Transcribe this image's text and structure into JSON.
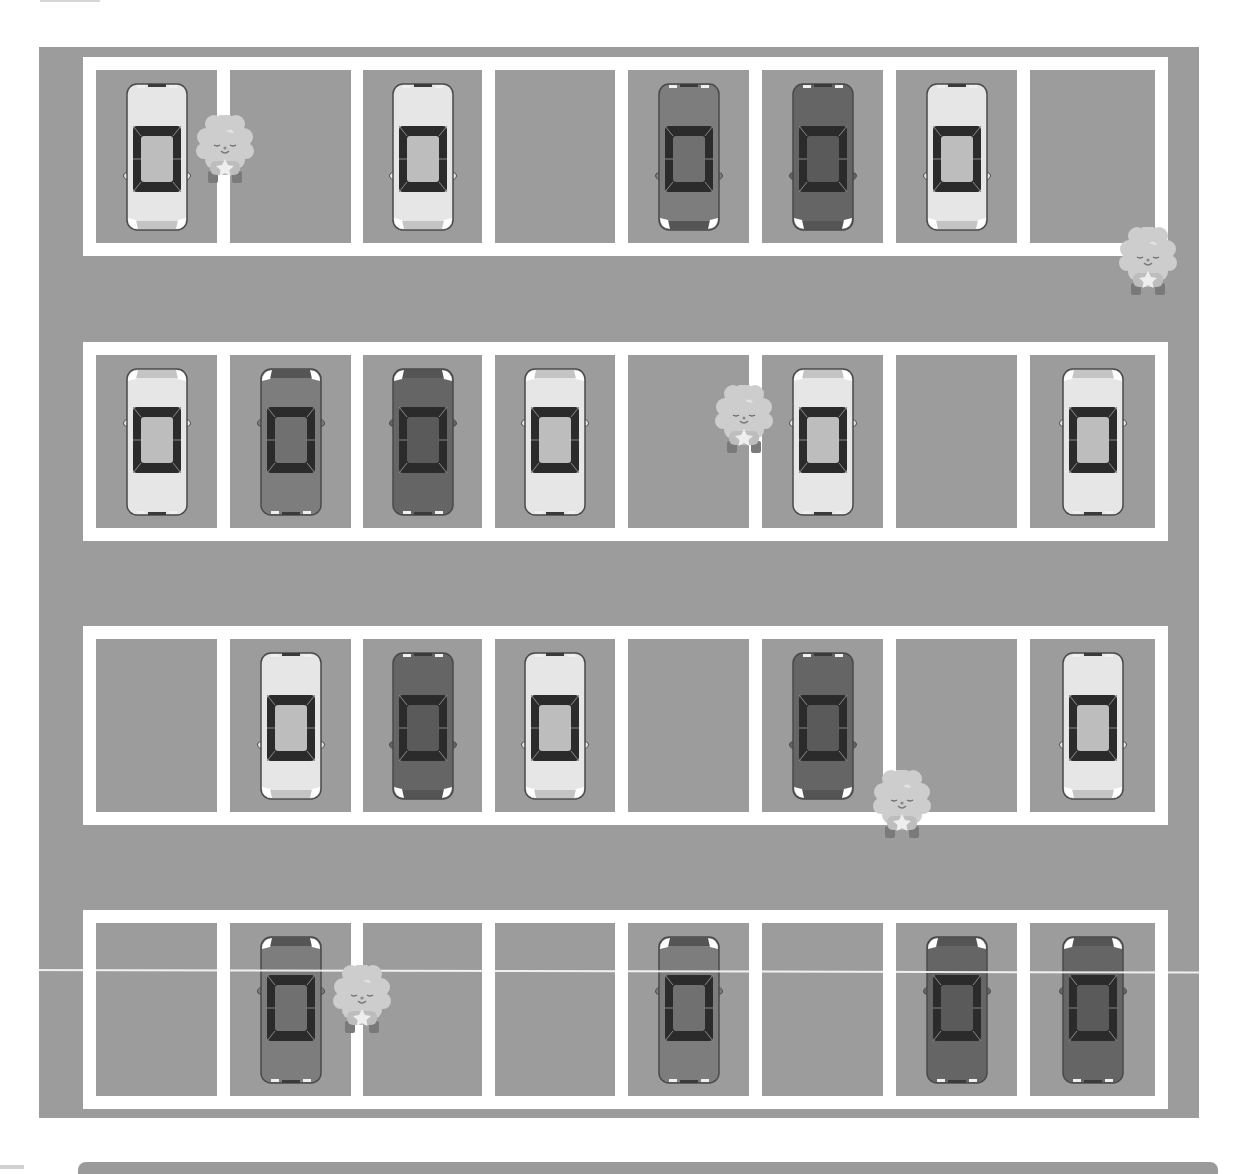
{
  "scene": {
    "title": "Parking lot illustration (top-down, grayscale)",
    "colors": {
      "asphalt": "#9c9c9c",
      "lines": "#ffffff",
      "car_light": "#e6e6e6",
      "car_mid": "#7d7d7d",
      "car_dark": "#656565",
      "glass": "#2b2b2b",
      "mascot": "#cfcfcf"
    },
    "rows": [
      {
        "orientation": "down",
        "stalls": [
          "light",
          "empty",
          "light",
          "empty",
          "mid",
          "dark",
          "light",
          "empty"
        ]
      },
      {
        "orientation": "up",
        "stalls": [
          "light",
          "mid",
          "dark",
          "light",
          "empty",
          "light",
          "empty",
          "light"
        ]
      },
      {
        "orientation": "down",
        "stalls": [
          "empty",
          "light",
          "dark",
          "light",
          "empty",
          "dark",
          "empty",
          "light"
        ]
      },
      {
        "orientation": "up",
        "stalls": [
          "empty",
          "mid",
          "empty",
          "empty",
          "mid",
          "empty",
          "dark",
          "dark"
        ]
      }
    ],
    "mascots": [
      {
        "x": 225,
        "y": 150
      },
      {
        "x": 1148,
        "y": 262
      },
      {
        "x": 744,
        "y": 420
      },
      {
        "x": 902,
        "y": 805
      },
      {
        "x": 362,
        "y": 1000
      }
    ],
    "counts": {
      "rows": 4,
      "stalls_per_row": 8,
      "cars": 20,
      "empty_stalls": 12,
      "mascots": 5
    }
  }
}
